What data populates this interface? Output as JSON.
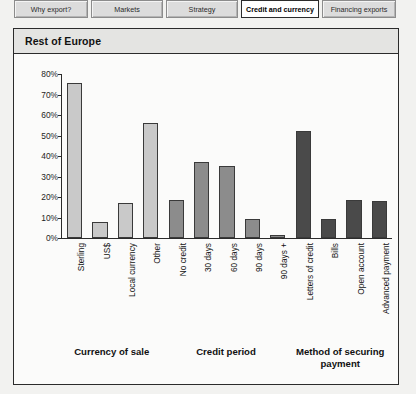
{
  "tabs": [
    {
      "label": "Why export?",
      "active": false
    },
    {
      "label": "Markets",
      "active": false
    },
    {
      "label": "Strategy",
      "active": false
    },
    {
      "label": "Credit and currency",
      "active": true
    },
    {
      "label": "Financing exports",
      "active": false
    }
  ],
  "panel": {
    "title": "Rest of Europe"
  },
  "chart_data": {
    "type": "bar",
    "title": "Rest of Europe",
    "xlabel": "",
    "ylabel": "",
    "ylim": [
      0,
      80
    ],
    "grid": false,
    "legend": "none",
    "ytick_labels": [
      "0%",
      "10%",
      "20%",
      "30%",
      "40%",
      "50%",
      "60%",
      "70%",
      "80%"
    ],
    "ytick_values": [
      0,
      10,
      20,
      30,
      40,
      50,
      60,
      70,
      80
    ],
    "categories": [
      "Sterling",
      "US$",
      "Local currency",
      "Other",
      "No credit",
      "30 days",
      "60 days",
      "90 days",
      "90 days +",
      "Letters of credit",
      "Bills",
      "Open account",
      "Advanced payment"
    ],
    "values": [
      75.5,
      8,
      17,
      56,
      18.5,
      37,
      35,
      9.5,
      1.5,
      52,
      9.5,
      18.5,
      18
    ],
    "bar_colors": [
      "#c9c9c9",
      "#c9c9c9",
      "#c9c9c9",
      "#c9c9c9",
      "#8c8c8c",
      "#8c8c8c",
      "#8c8c8c",
      "#8c8c8c",
      "#8c8c8c",
      "#4a4a4a",
      "#4a4a4a",
      "#4a4a4a",
      "#4a4a4a"
    ],
    "groups": [
      {
        "label": "Currency of sale",
        "start": 0,
        "end": 3,
        "color": "#c9c9c9"
      },
      {
        "label": "Credit period",
        "start": 4,
        "end": 8,
        "color": "#8c8c8c"
      },
      {
        "label": "Method of securing payment",
        "start": 9,
        "end": 12,
        "color": "#4a4a4a"
      }
    ]
  },
  "colors": {
    "page_background": "#f2f2f0",
    "panel_background": "#fbfbfa",
    "panel_header": "#e4e4e2",
    "border": "#2b2b2b",
    "tab_inactive": "#dcdcdc",
    "tab_active": "#ffffff",
    "bar_light": "#c9c9c9",
    "bar_medium": "#8c8c8c",
    "bar_dark": "#4a4a4a"
  }
}
